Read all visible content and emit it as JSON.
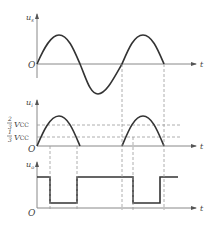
{
  "diagram": {
    "panels": [
      {
        "id": "input",
        "y_label": "u",
        "y_label_sub": "s",
        "x_label": "t",
        "origin_label": "O",
        "waveform": "sine"
      },
      {
        "id": "capacitor",
        "y_label": "u",
        "y_label_sub": "i",
        "x_label": "t",
        "origin_label": "O",
        "waveform": "rectified-half-sine",
        "thresholds": [
          {
            "num": "2",
            "den": "3",
            "label": "V",
            "sub": "CC"
          },
          {
            "num": "1",
            "den": "3",
            "label": "V",
            "sub": "CC"
          }
        ]
      },
      {
        "id": "output",
        "y_label": "u",
        "y_label_sub": "o",
        "x_label": "t",
        "origin_label": "O",
        "waveform": "square"
      }
    ],
    "colors": {
      "curve": "#333333",
      "axis": "#888888",
      "dashed": "#999999"
    }
  }
}
